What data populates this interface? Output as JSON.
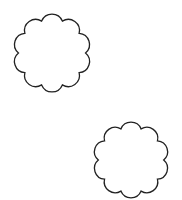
{
  "canvas": {
    "width": 182,
    "height": 200,
    "background": "#ffffff"
  },
  "shapes": [
    {
      "type": "scalloped-circle",
      "cx": 52,
      "cy": 53,
      "r": 39,
      "lobes": 10,
      "stroke": "#222222",
      "fill": "#ffffff"
    },
    {
      "type": "scalloped-circle",
      "cx": 131,
      "cy": 160,
      "r": 38,
      "lobes": 10,
      "stroke": "#222222",
      "fill": "#ffffff"
    }
  ]
}
